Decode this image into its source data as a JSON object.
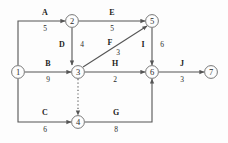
{
  "diagram": {
    "type": "activity-on-arrow-network",
    "title": "",
    "stroke_color": "#555555",
    "text_color": "#1e1e1e",
    "background": "#fdfdfd",
    "nodes": [
      {
        "id": "1",
        "label": "1",
        "x": 18,
        "y": 72
      },
      {
        "id": "2",
        "label": "2",
        "x": 72,
        "y": 21
      },
      {
        "id": "3",
        "label": "3",
        "x": 78,
        "y": 72
      },
      {
        "id": "4",
        "label": "4",
        "x": 78,
        "y": 122
      },
      {
        "id": "5",
        "label": "5",
        "x": 152,
        "y": 21
      },
      {
        "id": "6",
        "label": "6",
        "x": 152,
        "y": 72
      },
      {
        "id": "7",
        "label": "7",
        "x": 211,
        "y": 72
      }
    ],
    "activities": [
      {
        "name": "A",
        "duration": "5",
        "from": "1",
        "to": "2",
        "label_x": 45,
        "label_y": 10,
        "dur_x": 45,
        "dur_y": 27,
        "style": "solid"
      },
      {
        "name": "B",
        "duration": "9",
        "from": "1",
        "to": "3",
        "label_x": 48,
        "label_y": 62,
        "dur_x": 48,
        "dur_y": 78,
        "style": "solid"
      },
      {
        "name": "C",
        "duration": "6",
        "from": "1",
        "to": "4",
        "label_x": 45,
        "label_y": 110,
        "dur_x": 45,
        "dur_y": 128,
        "style": "solid"
      },
      {
        "name": "D",
        "duration": "4",
        "from": "2",
        "to": "3",
        "label_x": 60,
        "label_y": 42,
        "dur_x": 80,
        "dur_y": 42,
        "style": "solid"
      },
      {
        "name": "E",
        "duration": "5",
        "from": "2",
        "to": "5",
        "label_x": 112,
        "label_y": 10,
        "dur_x": 112,
        "dur_y": 27,
        "style": "solid"
      },
      {
        "name": "F",
        "duration": "3",
        "from": "3",
        "to": "5",
        "label_x": 110,
        "label_y": 40,
        "dur_x": 118,
        "dur_y": 50,
        "style": "solid"
      },
      {
        "name": "G",
        "duration": "8",
        "from": "4",
        "to": "6",
        "label_x": 116,
        "label_y": 110,
        "dur_x": 116,
        "dur_y": 128,
        "style": "solid"
      },
      {
        "name": "H",
        "duration": "2",
        "from": "3",
        "to": "6",
        "label_x": 115,
        "label_y": 62,
        "dur_x": 115,
        "dur_y": 78,
        "style": "solid"
      },
      {
        "name": "I",
        "duration": "6",
        "from": "5",
        "to": "6",
        "label_x": 141,
        "label_y": 42,
        "dur_x": 160,
        "dur_y": 42,
        "style": "solid"
      },
      {
        "name": "J",
        "duration": "3",
        "from": "6",
        "to": "7",
        "label_x": 182,
        "label_y": 62,
        "dur_x": 182,
        "dur_y": 78,
        "style": "solid"
      },
      {
        "name": "",
        "duration": "",
        "from": "3",
        "to": "4",
        "label_x": 0,
        "label_y": 0,
        "dur_x": 0,
        "dur_y": 0,
        "style": "dotted"
      }
    ]
  }
}
